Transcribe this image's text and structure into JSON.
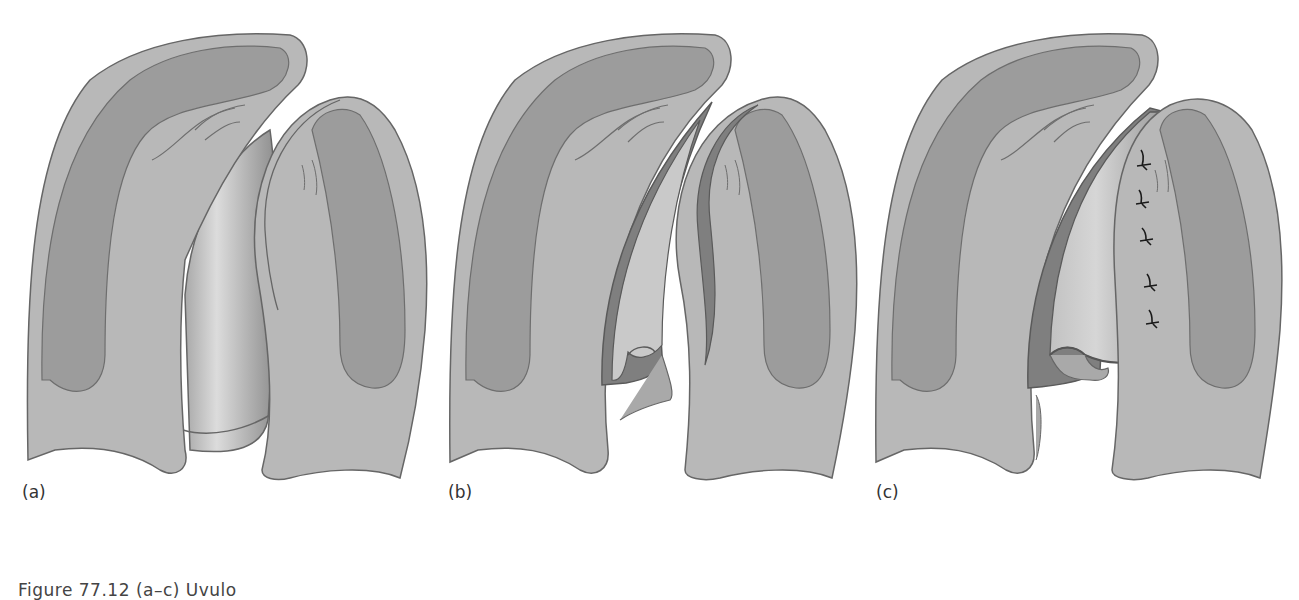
{
  "figure": {
    "panels": [
      {
        "id": "a",
        "label": "(a)"
      },
      {
        "id": "b",
        "label": "(b)"
      },
      {
        "id": "c",
        "label": "(c)"
      }
    ],
    "caption": "Figure 77.12  (a–c) Uvulo",
    "colors": {
      "background": "#ffffff",
      "tissue_light": "#b8b8b8",
      "tissue_dark": "#9c9c9c",
      "mucosa_highlight": "#c8c8c8",
      "outline": "#666666",
      "flap_dark": "#7a7a7a",
      "suture": "#1a1a1a"
    },
    "suture_count": 5
  }
}
